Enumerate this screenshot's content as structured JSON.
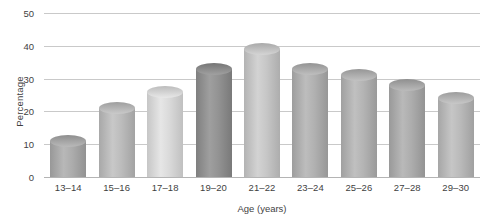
{
  "chart_data": {
    "type": "bar",
    "title": "",
    "xlabel": "Age (years)",
    "ylabel": "Percentage",
    "categories": [
      "13–14",
      "15–16",
      "17–18",
      "19–20",
      "21–22",
      "23–24",
      "25–26",
      "27–28",
      "29–30"
    ],
    "values": [
      11,
      21,
      26,
      33,
      39,
      33,
      31,
      28,
      24
    ],
    "yticks": [
      0,
      10,
      20,
      30,
      40,
      50
    ],
    "ylim": [
      0,
      50
    ],
    "xlim_note": "categorical",
    "grid": true,
    "legend": "none",
    "bar_colors": [
      "#a8a8a8",
      "#b8b8b8",
      "#d6d6d6",
      "#8f8f8f",
      "#c3c3c3",
      "#adadad",
      "#b0b0b0",
      "#a9a9a9",
      "#b6b6b6"
    ],
    "gridline_color": "#c9c9c9",
    "text_color": "#3f3f3f",
    "background": "#ffffff"
  }
}
